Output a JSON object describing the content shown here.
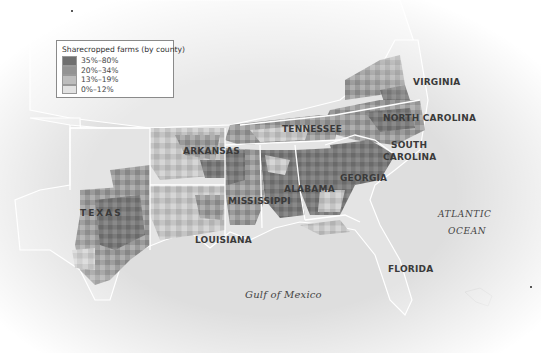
{
  "legend": {
    "title": "Sharecropped farms (by county)",
    "items": [
      {
        "label": "35%–80%",
        "color": "#6f6f6f"
      },
      {
        "label": "20%–34%",
        "color": "#939393"
      },
      {
        "label": "13%–19%",
        "color": "#bdbdbd"
      },
      {
        "label": "0%–12%",
        "color": "#e2e2e2"
      }
    ]
  },
  "labels": {
    "virginia": "VIRGINIA",
    "north_carolina": "NORTH CAROLINA",
    "tennessee": "TENNESSEE",
    "south_carolina_1": "SOUTH",
    "south_carolina_2": "CAROLINA",
    "arkansas": "ARKANSAS",
    "alabama": "ALABAMA",
    "georgia": "GEORGIA",
    "mississippi": "MISSISSIPPI",
    "texas": "TEXAS",
    "louisiana": "LOUISIANA",
    "florida": "FLORIDA",
    "atlantic_1": "ATLANTIC",
    "atlantic_2": "OCEAN",
    "gulf": "Gulf of Mexico"
  },
  "colors": {
    "land": "#e6e6e6",
    "water": "#d9d9d9",
    "border": "#ffffff",
    "label": "#3a3a3a"
  }
}
